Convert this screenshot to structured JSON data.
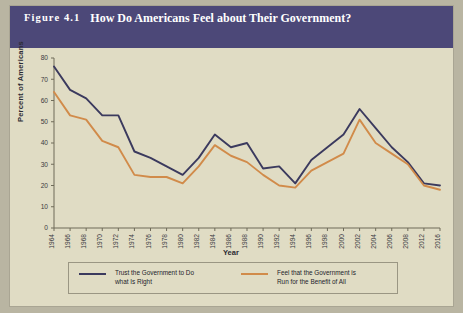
{
  "figure": {
    "label": "Figure 4.1",
    "title": "How Do Americans Feel about Their Government?"
  },
  "colors": {
    "header_background": "#4c4878",
    "page_background": "#e0dcc4",
    "series_trust": "#3b3a5e",
    "series_benefit": "#d18b4a",
    "axis": "#6f6b59",
    "text": "#2b2b33"
  },
  "chart_data": {
    "type": "line",
    "title": "How Do Americans Feel about Their Government?",
    "xlabel": "Year",
    "ylabel": "Percent of Americans",
    "ylim": [
      0,
      80
    ],
    "ytick_values": [
      0,
      10,
      20,
      30,
      40,
      50,
      60,
      70,
      80
    ],
    "grid": false,
    "legend_position": "bottom",
    "x": [
      1964,
      1966,
      1968,
      1970,
      1972,
      1974,
      1976,
      1978,
      1980,
      1982,
      1984,
      1986,
      1988,
      1990,
      1992,
      1994,
      1996,
      1998,
      2000,
      2002,
      2004,
      2006,
      2008,
      2012,
      2016
    ],
    "xtick_labels": [
      "1964",
      "1966",
      "1968",
      "1970",
      "1972",
      "1974",
      "1976",
      "1978",
      "1980",
      "1982",
      "1984",
      "1986",
      "1988",
      "1990",
      "1992",
      "1994",
      "1996",
      "1998",
      "2000",
      "2002",
      "2004",
      "2006",
      "2008",
      "2012",
      "2016"
    ],
    "series": [
      {
        "name": "Trust the Government to Do what Is Right",
        "color": "#3b3a5e",
        "values": [
          76,
          65,
          61,
          53,
          53,
          36,
          33,
          29,
          25,
          33,
          44,
          38,
          40,
          28,
          29,
          21,
          32,
          38,
          44,
          56,
          47,
          38,
          31,
          21,
          20
        ]
      },
      {
        "name": "Feel that the Government is Run for the Benefit of All",
        "color": "#d18b4a",
        "values": [
          64,
          53,
          51,
          41,
          38,
          25,
          24,
          24,
          21,
          29,
          39,
          34,
          31,
          25,
          20,
          19,
          27,
          31,
          35,
          51,
          40,
          35,
          30,
          20,
          18
        ]
      }
    ]
  },
  "legend": {
    "items": [
      {
        "line1": "Trust the Government to Do",
        "line2": "what Is Right",
        "color": "#3b3a5e"
      },
      {
        "line1": "Feel that the Government is",
        "line2": "Run for the Benefit of All",
        "color": "#d18b4a"
      }
    ]
  }
}
